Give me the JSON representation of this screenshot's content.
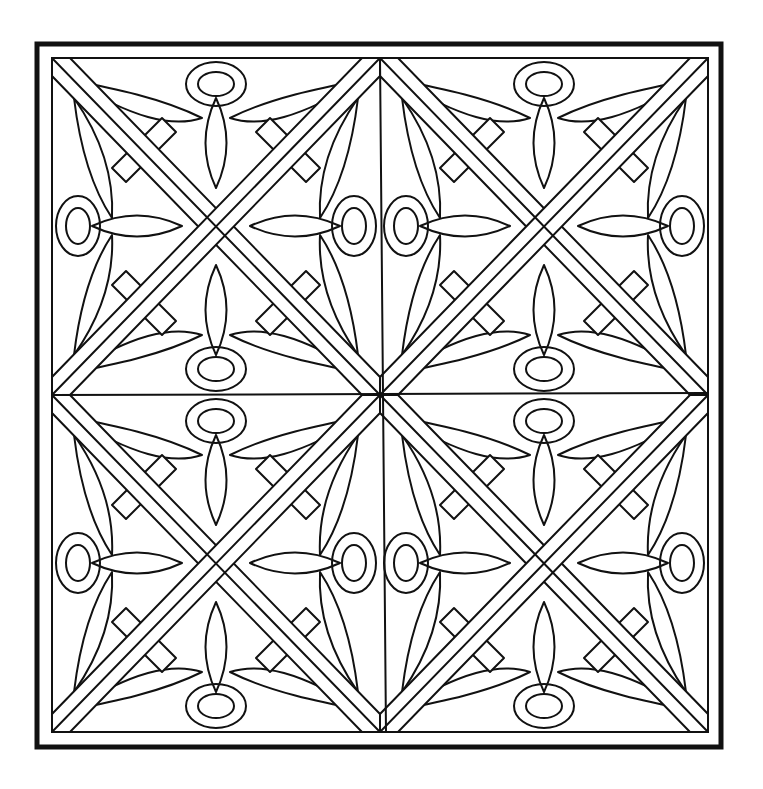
{
  "artwork": {
    "title": "Celtic knot square coloring page",
    "style": "black line art on white",
    "colors": {
      "line": "#111111",
      "background": "#ffffff"
    },
    "layout": {
      "tiles_x": 2,
      "tiles_y": 2
    },
    "frame": {
      "outer": [
        35,
        42,
        723,
        749
      ],
      "inner": [
        52,
        58,
        708,
        732
      ]
    }
  }
}
